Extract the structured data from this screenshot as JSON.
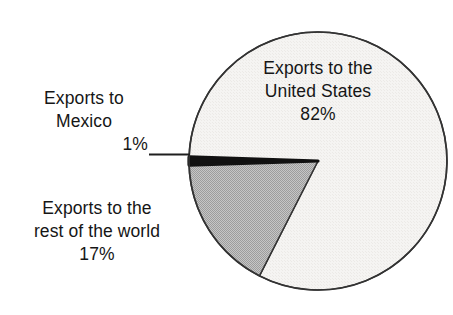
{
  "chart_data": {
    "type": "pie",
    "title": "",
    "subtitle": "",
    "xlabel": "",
    "ylabel": "",
    "legend_position": "none",
    "grid": false,
    "units": "percent",
    "categories": [
      "Exports to the United States",
      "Exports to the rest of the world",
      "Exports to Mexico"
    ],
    "values": [
      82,
      17,
      1
    ],
    "slices": [
      {
        "name": "Exports to the United States",
        "value": 82,
        "value_label": "82%",
        "color": "#f2f1ef",
        "label_placement": "inside"
      },
      {
        "name": "Exports to the rest of the world",
        "value": 17,
        "value_label": "17%",
        "color": "#b4b4b4",
        "label_placement": "outside-left"
      },
      {
        "name": "Exports to Mexico",
        "value": 1,
        "value_label": "1%",
        "color": "#111111",
        "label_placement": "outside-left-leader"
      }
    ],
    "start_angle_deg": 0,
    "direction": "clockwise",
    "outline_color": "#333333"
  },
  "labels": {
    "united_states": {
      "line1": "Exports to the",
      "line2": "United States",
      "percent": "82%"
    },
    "mexico": {
      "line1": "Exports to",
      "line2": "Mexico",
      "percent": "1%"
    },
    "rest_of_world": {
      "line1": "Exports to the",
      "line2": "rest of the world",
      "percent": "17%"
    }
  },
  "colors": {
    "background": "#ffffff",
    "text": "#161616",
    "slice_us": "#f2f1ef",
    "slice_row": "#b4b4b4",
    "slice_mexico": "#111111",
    "outline": "#333333",
    "leader_line": "#1f1f1f"
  }
}
